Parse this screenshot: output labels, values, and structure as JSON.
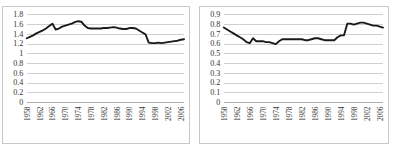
{
  "page": {
    "background_color": "#ffffff",
    "frame_color": "#c8c8c8",
    "line_color": "#1a1a1a",
    "grid_color": "#b9b9b9"
  },
  "chart_data": [
    {
      "id": "chart-left",
      "type": "line",
      "title": "",
      "subtitle": "",
      "xlabel": "",
      "ylabel": "",
      "grid": true,
      "legend": "none",
      "ylim": [
        0,
        1.8
      ],
      "yticks": [
        "0",
        "0.2",
        "0.4",
        "0.6",
        "0.8",
        "1",
        "1.2",
        "1.4",
        "1.6",
        "1.8"
      ],
      "ytick_values": [
        0,
        0.2,
        0.4,
        0.6,
        0.8,
        1,
        1.2,
        1.4,
        1.6,
        1.8
      ],
      "xticks": [
        "1958",
        "1962",
        "1966",
        "1970",
        "1974",
        "1978",
        "1982",
        "1986",
        "1990",
        "1994",
        "1998",
        "2002",
        "2006"
      ],
      "xlim": [
        1958,
        2007
      ],
      "x": [
        1958,
        1959,
        1960,
        1961,
        1962,
        1963,
        1964,
        1965,
        1966,
        1967,
        1968,
        1969,
        1970,
        1971,
        1972,
        1973,
        1974,
        1975,
        1976,
        1977,
        1978,
        1979,
        1980,
        1981,
        1982,
        1983,
        1984,
        1985,
        1986,
        1987,
        1988,
        1989,
        1990,
        1991,
        1992,
        1993,
        1994,
        1995,
        1996,
        1997,
        1998,
        1999,
        2000,
        2001,
        2002,
        2003,
        2004,
        2005,
        2006,
        2007
      ],
      "values": [
        1.32,
        1.35,
        1.38,
        1.42,
        1.45,
        1.48,
        1.52,
        1.57,
        1.62,
        1.5,
        1.52,
        1.56,
        1.58,
        1.6,
        1.62,
        1.65,
        1.67,
        1.66,
        1.58,
        1.53,
        1.52,
        1.52,
        1.52,
        1.52,
        1.53,
        1.53,
        1.54,
        1.55,
        1.54,
        1.52,
        1.51,
        1.51,
        1.53,
        1.53,
        1.52,
        1.48,
        1.44,
        1.4,
        1.23,
        1.22,
        1.22,
        1.23,
        1.22,
        1.23,
        1.24,
        1.25,
        1.26,
        1.27,
        1.29,
        1.3
      ]
    },
    {
      "id": "chart-right",
      "type": "line",
      "title": "",
      "subtitle": "",
      "xlabel": "",
      "ylabel": "",
      "grid": true,
      "legend": "none",
      "ylim": [
        0,
        0.9
      ],
      "yticks": [
        "0",
        "0.1",
        "0.2",
        "0.3",
        "0.4",
        "0.5",
        "0.6",
        "0.7",
        "0.8",
        "0.9"
      ],
      "ytick_values": [
        0,
        0.1,
        0.2,
        0.3,
        0.4,
        0.5,
        0.6,
        0.7,
        0.8,
        0.9
      ],
      "xticks": [
        "1958",
        "1962",
        "1966",
        "1970",
        "1974",
        "1978",
        "1982",
        "1986",
        "1990",
        "1994",
        "1998",
        "2002",
        "2006"
      ],
      "xlim": [
        1958,
        2007
      ],
      "x": [
        1958,
        1959,
        1960,
        1961,
        1962,
        1963,
        1964,
        1965,
        1966,
        1967,
        1968,
        1969,
        1970,
        1971,
        1972,
        1973,
        1974,
        1975,
        1976,
        1977,
        1978,
        1979,
        1980,
        1981,
        1982,
        1983,
        1984,
        1985,
        1986,
        1987,
        1988,
        1989,
        1990,
        1991,
        1992,
        1993,
        1994,
        1995,
        1996,
        1997,
        1998,
        1999,
        2000,
        2001,
        2002,
        2003,
        2004,
        2005,
        2006,
        2007
      ],
      "values": [
        0.77,
        0.75,
        0.73,
        0.71,
        0.69,
        0.67,
        0.65,
        0.62,
        0.61,
        0.66,
        0.63,
        0.63,
        0.63,
        0.62,
        0.62,
        0.61,
        0.6,
        0.63,
        0.65,
        0.65,
        0.65,
        0.65,
        0.65,
        0.65,
        0.65,
        0.64,
        0.64,
        0.65,
        0.66,
        0.66,
        0.65,
        0.64,
        0.64,
        0.64,
        0.64,
        0.67,
        0.69,
        0.69,
        0.81,
        0.81,
        0.8,
        0.81,
        0.82,
        0.82,
        0.81,
        0.8,
        0.79,
        0.79,
        0.78,
        0.77
      ]
    }
  ]
}
